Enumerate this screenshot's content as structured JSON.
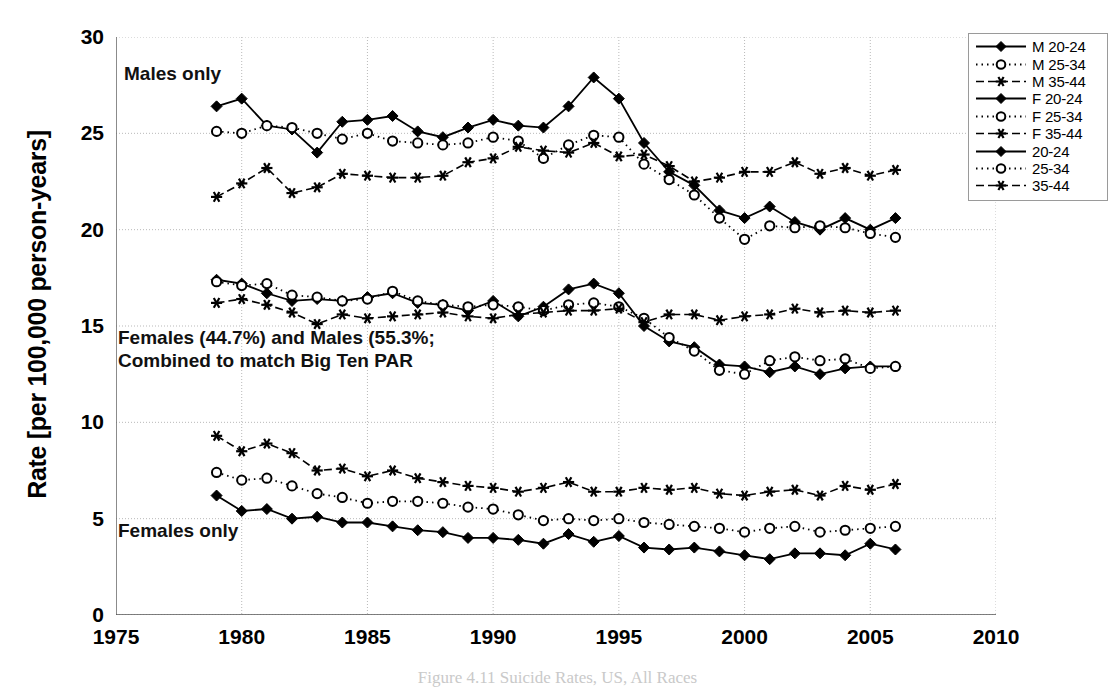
{
  "axes": {
    "ylabel": "Rate [per 100,000 person-years]",
    "yticks": [
      "0",
      "5",
      "10",
      "15",
      "20",
      "25",
      "30"
    ],
    "xticks": [
      "1975",
      "1980",
      "1985",
      "1990",
      "1995",
      "2000",
      "2005",
      "2010"
    ],
    "ylim": [
      0,
      30
    ],
    "xlim": [
      1975,
      2010
    ]
  },
  "annotations": {
    "top": "Males only",
    "middle": "Females (44.7%) and Males (55.3%;\nCombined to match Big Ten PAR",
    "bottom": "Females only"
  },
  "legend": {
    "items": [
      {
        "label": "M 20-24",
        "style": "solid-diamond"
      },
      {
        "label": "M 25-34",
        "style": "dotted-circle"
      },
      {
        "label": "M 35-44",
        "style": "dashed-star"
      },
      {
        "label": "F 20-24",
        "style": "solid-diamond"
      },
      {
        "label": "F 25-34",
        "style": "dotted-circle"
      },
      {
        "label": "F 35-44",
        "style": "dashed-star"
      },
      {
        "label": "20-24",
        "style": "solid-diamond"
      },
      {
        "label": "25-34",
        "style": "dotted-circle"
      },
      {
        "label": "35-44",
        "style": "dashed-star"
      }
    ]
  },
  "caption": "Figure 4.11  Suicide Rates, US, All Races",
  "chart_data": {
    "type": "line",
    "title": "",
    "xlabel": "",
    "ylabel": "Rate [per 100,000 person-years]",
    "xlim": [
      1975,
      2010
    ],
    "ylim": [
      0,
      30
    ],
    "grid": true,
    "legend_position": "top-right-outside",
    "x": [
      1979,
      1980,
      1981,
      1982,
      1983,
      1984,
      1985,
      1986,
      1987,
      1988,
      1989,
      1990,
      1991,
      1992,
      1993,
      1994,
      1995,
      1996,
      1997,
      1998,
      1999,
      2000,
      2001,
      2002,
      2003,
      2004,
      2005,
      2006
    ],
    "series": [
      {
        "name": "M 20-24",
        "style": "solid-diamond",
        "group": "Males only",
        "values": [
          26.4,
          26.8,
          25.4,
          25.2,
          24.0,
          25.6,
          25.7,
          25.9,
          25.1,
          24.8,
          25.3,
          25.7,
          25.4,
          25.3,
          26.4,
          27.9,
          26.8,
          24.5,
          23.0,
          22.3,
          21.0,
          20.6,
          21.2,
          20.4,
          20.0,
          20.6,
          20.0,
          20.6
        ]
      },
      {
        "name": "M 25-34",
        "style": "dotted-circle",
        "group": "Males only",
        "values": [
          25.1,
          25.0,
          25.4,
          25.3,
          25.0,
          24.7,
          25.0,
          24.6,
          24.5,
          24.4,
          24.5,
          24.8,
          24.6,
          23.7,
          24.4,
          24.9,
          24.8,
          23.4,
          22.6,
          21.8,
          20.6,
          19.5,
          20.2,
          20.1,
          20.2,
          20.1,
          19.8,
          19.6
        ]
      },
      {
        "name": "M 35-44",
        "style": "dashed-star",
        "group": "Males only",
        "values": [
          21.7,
          22.4,
          23.2,
          21.9,
          22.2,
          22.9,
          22.8,
          22.7,
          22.7,
          22.8,
          23.5,
          23.7,
          24.3,
          24.1,
          24.0,
          24.5,
          23.8,
          23.9,
          23.3,
          22.5,
          22.7,
          23.0,
          23.0,
          23.5,
          22.9,
          23.2,
          22.8,
          23.1
        ]
      },
      {
        "name": "20-24",
        "style": "solid-diamond",
        "group": "Combined",
        "values": [
          17.4,
          17.2,
          16.7,
          16.3,
          16.4,
          16.3,
          16.5,
          16.7,
          16.2,
          16.1,
          15.8,
          16.3,
          15.5,
          16.0,
          16.9,
          17.2,
          16.7,
          15.0,
          14.2,
          13.9,
          13.0,
          12.9,
          12.6,
          12.9,
          12.5,
          12.8,
          12.9,
          12.9
        ]
      },
      {
        "name": "25-34",
        "style": "dotted-circle",
        "group": "Combined",
        "values": [
          17.3,
          17.1,
          17.2,
          16.6,
          16.5,
          16.3,
          16.4,
          16.8,
          16.3,
          16.1,
          16.0,
          16.1,
          16.0,
          15.8,
          16.1,
          16.2,
          16.0,
          15.4,
          14.4,
          13.7,
          12.7,
          12.5,
          13.2,
          13.4,
          13.2,
          13.3,
          12.8,
          12.9
        ]
      },
      {
        "name": "35-44",
        "style": "dashed-star",
        "group": "Combined",
        "values": [
          16.2,
          16.4,
          16.1,
          15.7,
          15.1,
          15.6,
          15.4,
          15.5,
          15.6,
          15.7,
          15.5,
          15.4,
          15.6,
          15.7,
          15.8,
          15.8,
          15.9,
          15.2,
          15.6,
          15.6,
          15.3,
          15.5,
          15.6,
          15.9,
          15.7,
          15.8,
          15.7,
          15.8
        ]
      },
      {
        "name": "F 20-24",
        "style": "solid-diamond",
        "group": "Females only",
        "values": [
          6.2,
          5.4,
          5.5,
          5.0,
          5.1,
          4.8,
          4.8,
          4.6,
          4.4,
          4.3,
          4.0,
          4.0,
          3.9,
          3.7,
          4.2,
          3.8,
          4.1,
          3.5,
          3.4,
          3.5,
          3.3,
          3.1,
          2.9,
          3.2,
          3.2,
          3.1,
          3.7,
          3.4
        ]
      },
      {
        "name": "F 25-34",
        "style": "dotted-circle",
        "group": "Females only",
        "values": [
          7.4,
          7.0,
          7.1,
          6.7,
          6.3,
          6.1,
          5.8,
          5.9,
          5.9,
          5.8,
          5.6,
          5.5,
          5.2,
          4.9,
          5.0,
          4.9,
          5.0,
          4.8,
          4.7,
          4.6,
          4.5,
          4.3,
          4.5,
          4.6,
          4.3,
          4.4,
          4.5,
          4.6
        ]
      },
      {
        "name": "F 35-44",
        "style": "dashed-star",
        "group": "Females only",
        "values": [
          9.3,
          8.5,
          8.9,
          8.4,
          7.5,
          7.6,
          7.2,
          7.5,
          7.1,
          6.9,
          6.7,
          6.6,
          6.4,
          6.6,
          6.9,
          6.4,
          6.4,
          6.6,
          6.5,
          6.6,
          6.3,
          6.2,
          6.4,
          6.5,
          6.2,
          6.7,
          6.5,
          6.8
        ]
      }
    ]
  }
}
